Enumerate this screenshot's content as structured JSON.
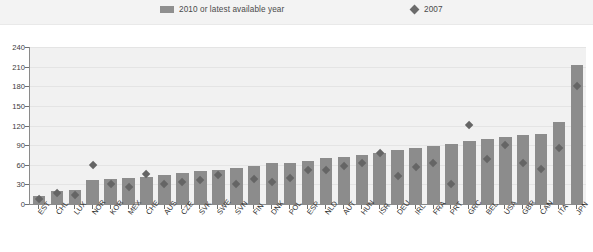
{
  "legend": {
    "items": [
      {
        "label": "2010 or latest available year",
        "marker": "bar-swatch",
        "color": "#8f8f8f"
      },
      {
        "label": "2007",
        "marker": "diamond-swatch",
        "color": "#6b6b6b"
      }
    ]
  },
  "chart_data": {
    "type": "bar",
    "title": "",
    "subtitle": "",
    "xlabel": "",
    "ylabel": "",
    "ylim": [
      0,
      240
    ],
    "yticks": [
      0,
      30,
      60,
      90,
      120,
      150,
      180,
      210,
      240
    ],
    "grid": true,
    "legend_position": "top",
    "categories": [
      "EST",
      "CHL",
      "LUX",
      "NOR",
      "KOR",
      "MEX",
      "CHE",
      "AUS",
      "CZE",
      "SVK",
      "SWE",
      "SVN",
      "FIN",
      "DNK",
      "POL",
      "ESP",
      "NLD",
      "AUT",
      "HUN",
      "ISR",
      "DEU",
      "IRL",
      "FRA",
      "PRT",
      "GRC",
      "BEL",
      "USA",
      "GBR",
      "CAN",
      "ITA",
      "JPN"
    ],
    "series": [
      {
        "name": "2010 or latest available year",
        "type": "bar",
        "color": "#8c8c8c",
        "values": [
          12,
          20,
          22,
          37,
          38,
          40,
          42,
          45,
          47,
          50,
          52,
          55,
          58,
          62,
          63,
          66,
          70,
          72,
          75,
          78,
          82,
          86,
          89,
          92,
          97,
          100,
          103,
          105,
          107,
          125,
          213
        ]
      },
      {
        "name": "2007",
        "type": "scatter",
        "marker": "diamond",
        "color": "#656565",
        "values": [
          8,
          16,
          14,
          60,
          30,
          26,
          45,
          30,
          34,
          36,
          44,
          30,
          38,
          34,
          40,
          52,
          52,
          58,
          63,
          78,
          43,
          57,
          63,
          31,
          120,
          68,
          90,
          63,
          53,
          86,
          180
        ]
      }
    ]
  }
}
